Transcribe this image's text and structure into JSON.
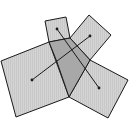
{
  "diagram": {
    "title": "",
    "colors": {
      "fill": "#d4d4d4",
      "overlap_fill": "#a8a8a8",
      "stroke": "#1a1a1a",
      "background": "#ffffff"
    },
    "shapes": [
      {
        "name": "large-left-rectangle",
        "points": "1,61 49,42 69,97 16,117"
      },
      {
        "name": "small-top-rectangle",
        "points": "45,21 66,17 70,38 49,42"
      },
      {
        "name": "upper-right-rectangle",
        "points": "89,15 111,35 90,60 70,38"
      },
      {
        "name": "lower-right-rectangle",
        "points": "90,60 128,80 108,118 69,97"
      }
    ],
    "overlap": {
      "name": "overlap-region",
      "points": "49,42 70,38 90,60 69,97 57,62"
    },
    "segments": [
      {
        "name": "segment-left-to-upper-right",
        "x1": 32,
        "y1": 80,
        "x2": 90,
        "y2": 36
      },
      {
        "name": "segment-top-to-lower-right",
        "x1": 57,
        "y1": 29,
        "x2": 99,
        "y2": 88
      }
    ]
  }
}
